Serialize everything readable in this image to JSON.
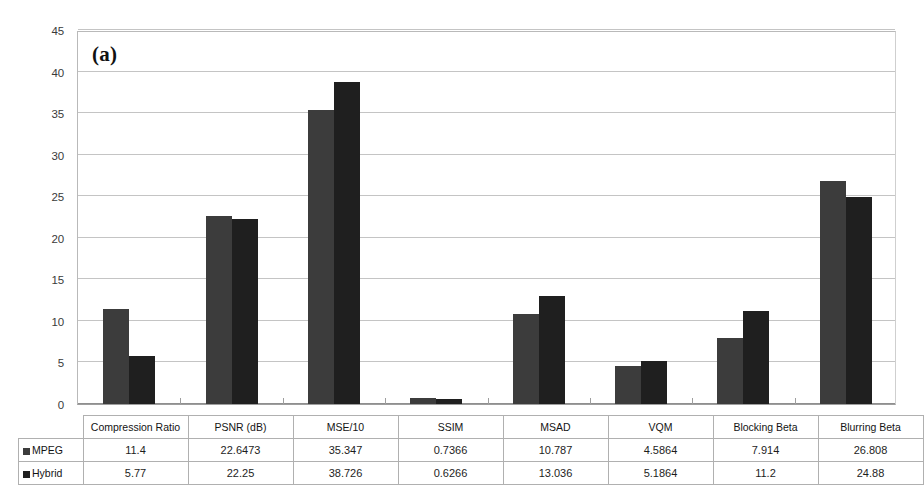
{
  "figure": {
    "panel_label": "(a)"
  },
  "legend": {
    "series": [
      {
        "name": "MPEG",
        "color": "#3c3c3c",
        "icon": "square-swatch-icon"
      },
      {
        "name": "Hybrid",
        "color": "#1f1f1f",
        "icon": "square-swatch-icon"
      }
    ]
  },
  "table": {
    "corner_label": "",
    "row_labels": [
      "MPEG",
      "Hybrid"
    ]
  },
  "chart_data": {
    "type": "bar",
    "title": "(a)",
    "xlabel": "",
    "ylabel": "",
    "ylim": [
      0,
      45
    ],
    "ytick_step": 5,
    "yticks": [
      "0",
      "5",
      "10",
      "15",
      "20",
      "25",
      "30",
      "35",
      "40",
      "45"
    ],
    "grid": true,
    "legend_position": "table-row-headers",
    "categories": [
      "Compression Ratio",
      "PSNR (dB)",
      "MSE/10",
      "SSIM",
      "MSAD",
      "VQM",
      "Blocking Beta",
      "Blurring Beta"
    ],
    "series": [
      {
        "name": "MPEG",
        "color": "#3c3c3c",
        "values": [
          11.4,
          22.6473,
          35.347,
          0.7366,
          10.787,
          4.5864,
          7.914,
          26.808
        ],
        "labels": [
          "11.4",
          "22.6473",
          "35.347",
          "0.7366",
          "10.787",
          "4.5864",
          "7.914",
          "26.808"
        ]
      },
      {
        "name": "Hybrid",
        "color": "#1f1f1f",
        "values": [
          5.77,
          22.25,
          38.726,
          0.6266,
          13.036,
          5.1864,
          11.2,
          24.88
        ],
        "labels": [
          "5.77",
          "22.25",
          "38.726",
          "0.6266",
          "13.036",
          "5.1864",
          "11.2",
          "24.88"
        ]
      }
    ]
  }
}
